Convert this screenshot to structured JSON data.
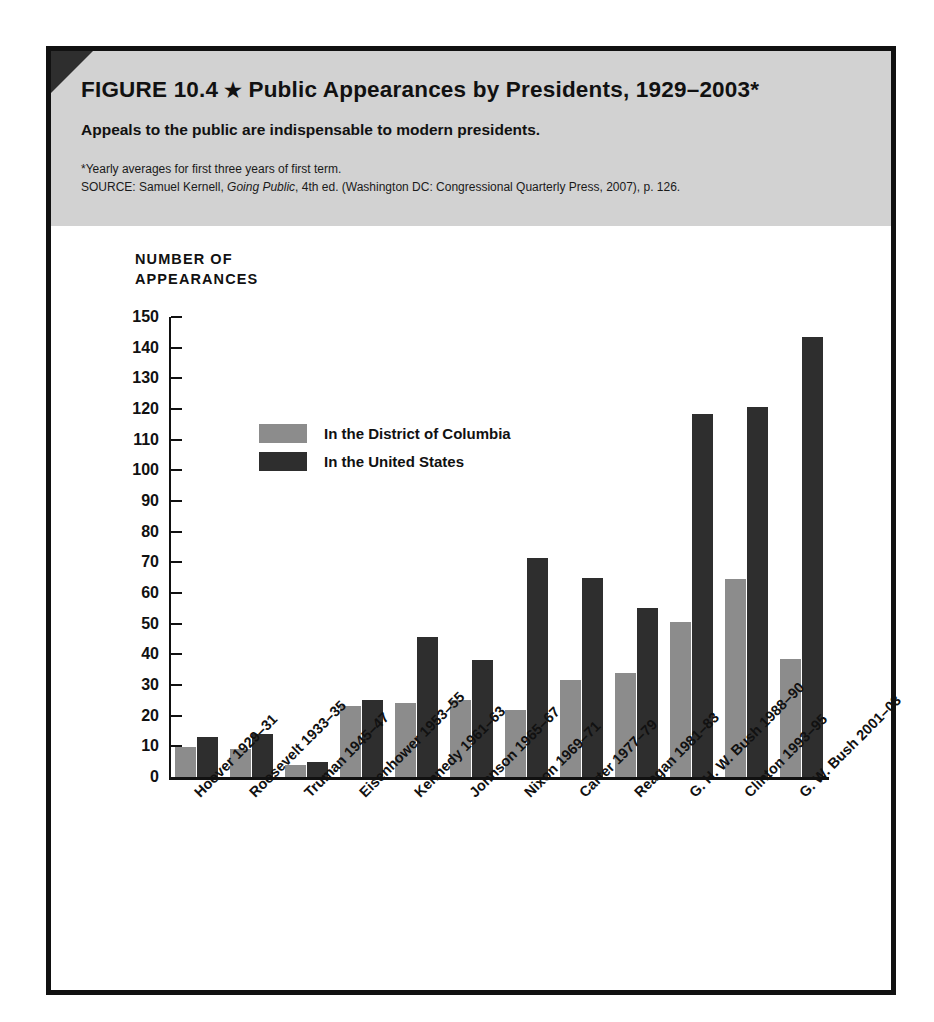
{
  "figure": {
    "label": "FIGURE 10.4",
    "star": "★",
    "title": "Public Appearances by Presidents, 1929–2003*",
    "subtitle": "Appeals to the public are indispensable to modern presidents.",
    "footnote": "*Yearly averages for first three years of first term.",
    "source_prefix": "SOURCE: Samuel Kernell, ",
    "source_italic": "Going Public",
    "source_suffix": ", 4th ed. (Washington DC: Congressional Quarterly Press, 2007), p. 126."
  },
  "colors": {
    "header_band": "#d2d2d2",
    "frame": "#111111",
    "series_dc": "#8c8c8c",
    "series_us": "#2e2e2e",
    "text": "#111111",
    "page_background": "#ffffff"
  },
  "chart_data": {
    "type": "bar",
    "title": "Public Appearances by Presidents, 1929–2003*",
    "subtitle": "Appeals to the public are indispensable to modern presidents.",
    "xlabel": "",
    "ylabel": "NUMBER OF\nAPPEARANCES",
    "ylim": [
      0,
      150
    ],
    "ytick_step": 10,
    "yticks": [
      0,
      10,
      20,
      30,
      40,
      50,
      60,
      70,
      80,
      90,
      100,
      110,
      120,
      130,
      140,
      150
    ],
    "grid": false,
    "legend_position": "inside-upper-left",
    "categories": [
      "Hoover 1929–31",
      "Roosevelt 1933–35",
      "Truman 1945–47",
      "Eisenhower 1953–55",
      "Kennedy 1961–63",
      "Johnson 1965–67",
      "Nixon 1969–71",
      "Carter 1977–79",
      "Reagan 1981–83",
      "G. H. W. Bush 1988–90",
      "Clinton 1993–95",
      "G. W. Bush 2001–03"
    ],
    "series": [
      {
        "name": "In the District of Columbia",
        "color": "#8c8c8c",
        "values": [
          9.7,
          9,
          4,
          23,
          24,
          25,
          22,
          31.5,
          34,
          50.5,
          64.5,
          38.5
        ]
      },
      {
        "name": "In the United States",
        "color": "#2e2e2e",
        "values": [
          13,
          14,
          5,
          25,
          45.5,
          38,
          71.5,
          65,
          55,
          118.5,
          120.5,
          143.5
        ]
      }
    ]
  }
}
